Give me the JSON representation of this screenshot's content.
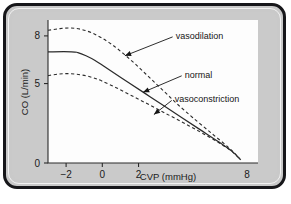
{
  "figure": {
    "name": "cardiac-output-cvp-curves",
    "frame_color": "#17171a",
    "panel_color": "#cacaca",
    "plot_background": "#fdfdfd",
    "ink_color": "#2b2b2b"
  },
  "chart_data": {
    "type": "line",
    "title": "",
    "xlabel": "CVP (mmHg)",
    "ylabel": "CO (L/min)",
    "xlim": [
      -3,
      8.6
    ],
    "ylim": [
      0,
      9.0
    ],
    "xticks": [
      -2,
      0,
      2,
      8
    ],
    "xticklabels": [
      "−2",
      "0",
      "2",
      "8"
    ],
    "yticks": [
      0,
      5,
      8
    ],
    "yticklabels": [
      "0",
      "5",
      "8"
    ],
    "grid": false,
    "legend": "annotations",
    "series": [
      {
        "name": "vasodilation",
        "style": "dashed",
        "points": [
          [
            -3.0,
            8.35
          ],
          [
            -2.4,
            8.45
          ],
          [
            -1.8,
            8.5
          ],
          [
            -1.2,
            8.42
          ],
          [
            -0.6,
            8.2
          ],
          [
            0.0,
            7.85
          ],
          [
            0.6,
            7.4
          ],
          [
            1.2,
            6.85
          ],
          [
            1.8,
            6.25
          ],
          [
            2.4,
            5.6
          ],
          [
            3.0,
            4.95
          ],
          [
            3.6,
            4.3
          ],
          [
            4.2,
            3.65
          ],
          [
            5.0,
            2.85
          ],
          [
            6.0,
            1.9
          ],
          [
            7.0,
            0.95
          ],
          [
            7.6,
            0.25
          ]
        ]
      },
      {
        "name": "normal",
        "style": "solid",
        "points": [
          [
            -3.0,
            7.0
          ],
          [
            -1.7,
            7.0
          ],
          [
            -1.35,
            6.95
          ],
          [
            -0.9,
            6.75
          ],
          [
            -0.4,
            6.45
          ],
          [
            0.4,
            5.85
          ],
          [
            1.4,
            5.1
          ],
          [
            2.4,
            4.35
          ],
          [
            3.4,
            3.6
          ],
          [
            4.4,
            2.85
          ],
          [
            5.4,
            2.1
          ],
          [
            6.4,
            1.35
          ],
          [
            7.2,
            0.7
          ],
          [
            7.65,
            0.2
          ]
        ]
      },
      {
        "name": "vasoconstriction",
        "style": "dashed",
        "points": [
          [
            -3.0,
            5.5
          ],
          [
            -2.4,
            5.6
          ],
          [
            -1.8,
            5.62
          ],
          [
            -1.2,
            5.55
          ],
          [
            -0.6,
            5.4
          ],
          [
            0.0,
            5.15
          ],
          [
            0.8,
            4.72
          ],
          [
            1.6,
            4.25
          ],
          [
            2.4,
            3.78
          ],
          [
            3.2,
            3.3
          ],
          [
            4.0,
            2.82
          ],
          [
            4.8,
            2.33
          ],
          [
            5.6,
            1.83
          ],
          [
            6.4,
            1.3
          ],
          [
            7.1,
            0.78
          ],
          [
            7.62,
            0.22
          ]
        ]
      }
    ],
    "annotations": [
      {
        "label": "vasodilation",
        "text_x": 4.05,
        "text_y": 8.0,
        "target_x": 1.25,
        "target_y": 6.75
      },
      {
        "label": "normal",
        "text_x": 4.55,
        "text_y": 5.55,
        "target_x": 2.25,
        "target_y": 4.45
      },
      {
        "label": "vasoconstriction",
        "text_x": 4.0,
        "text_y": 4.0,
        "target_x": 2.85,
        "target_y": 3.05
      }
    ]
  }
}
